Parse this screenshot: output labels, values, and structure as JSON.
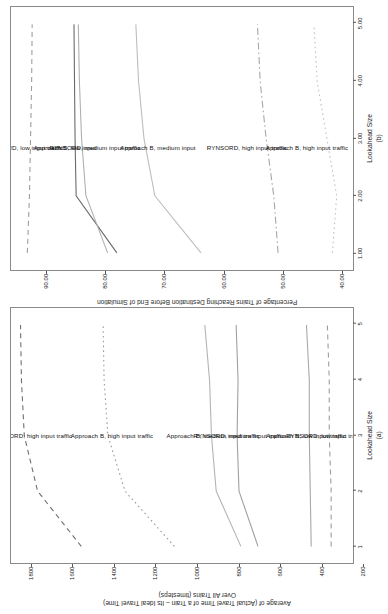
{
  "figure": {
    "panels": [
      "a",
      "b"
    ]
  },
  "chart_data": [
    {
      "id": "panel-a",
      "type": "line",
      "title": "",
      "panel_label": "(a)",
      "xlabel": "Lookahead Size",
      "ylabel": "Average of (Actual Travel Time of a Train – Its Ideal Travel Time)\nOver All Trains (timesteps)",
      "x": [
        1,
        2,
        3,
        4,
        5
      ],
      "xticklabels": [
        "1",
        "2",
        "3",
        "4",
        "5"
      ],
      "xlim": [
        0.7,
        5.3
      ],
      "ylim": [
        100,
        1900
      ],
      "yticks": [
        200,
        400,
        600,
        800,
        1000,
        1200,
        1400,
        1600,
        1800
      ],
      "yticklabels": [
        "200",
        "400",
        "600",
        "800",
        "1000",
        "1200",
        "1400",
        "1600",
        "1800"
      ],
      "grid": false,
      "legend_position": "inline-labels",
      "series": [
        {
          "name": "RYNSORD, high input traffic",
          "values": [
            1530,
            1760,
            1830,
            1845,
            1850
          ],
          "style": "dashed",
          "color": "#6f6f6f",
          "label_x": 3.05,
          "label_y": 1790
        },
        {
          "name": "Approach B, high input traffic",
          "values": [
            1040,
            1300,
            1390,
            1410,
            1415
          ],
          "style": "dotted",
          "color": "#9a9a9a",
          "label_x": 3.05,
          "label_y": 1370
        },
        {
          "name": "Approach B, medium input traffic",
          "values": [
            690,
            820,
            845,
            855,
            880
          ],
          "style": "solid",
          "color": "#b4b4b4",
          "label_x": 3.05,
          "label_y": 835
        },
        {
          "name": "RYNSORD, medium input traffic",
          "values": [
            600,
            700,
            710,
            705,
            715
          ],
          "style": "solid",
          "color": "#a0a0a0",
          "label_x": 3.05,
          "label_y": 700
        },
        {
          "name": "Approach B, low input traffic",
          "values": [
            320,
            325,
            330,
            330,
            345
          ],
          "style": "solid",
          "color": "#a8a8a8",
          "label_x": 3.05,
          "label_y": 345
        },
        {
          "name": "RYNSORD, low input traffic",
          "values": [
            215,
            215,
            225,
            225,
            235
          ],
          "style": "dashed",
          "color": "#9d9d9d",
          "label_x": 3.05,
          "label_y": 250
        }
      ]
    },
    {
      "id": "panel-b",
      "type": "line",
      "title": "",
      "panel_label": "(b)",
      "xlabel": "Lookahead Size",
      "ylabel": "Percentage of Trains Reaching Destination Before End of Simulation",
      "x": [
        1,
        2,
        3,
        4,
        5
      ],
      "xticklabels": [
        "1.00",
        "2.00",
        "3.00",
        "4.00",
        "5.00"
      ],
      "xlim": [
        0.7,
        5.3
      ],
      "ylim": [
        33,
        96
      ],
      "yticks": [
        40,
        50,
        60,
        70,
        80,
        90
      ],
      "yticklabels": [
        "40.00",
        "50.00",
        "60.00",
        "70.00",
        "80.00",
        "90.00"
      ],
      "grid": false,
      "legend_position": "inline-labels",
      "series": [
        {
          "name": "RYNSORD, low input traffic",
          "values": [
            93.0,
            92.6,
            92.4,
            92.2,
            92.1
          ],
          "style": "dashed",
          "color": "#9d9d9d",
          "label_x": 2.9,
          "label_y": 93.6
        },
        {
          "name": "Approach B, low input",
          "values": [
            76.5,
            84.0,
            84.2,
            84.3,
            84.4
          ],
          "style": "solid",
          "color": "#6a6a6a",
          "label_x": 2.9,
          "label_y": 86.0
        },
        {
          "name": "RYNSORD, medium input traffic",
          "values": [
            78.2,
            82.2,
            83.0,
            83.4,
            83.6
          ],
          "style": "solid",
          "color": "#b0b0b0",
          "label_x": 2.9,
          "label_y": 80.5
        },
        {
          "name": "Approach B, medium input",
          "values": [
            61.0,
            69.5,
            71.5,
            72.5,
            73.0
          ],
          "style": "solid",
          "color": "#bdbdbd",
          "label_x": 2.9,
          "label_y": 69.0
        },
        {
          "name": "RYNSORD, high input traffic",
          "values": [
            46.8,
            47.6,
            49.0,
            50.1,
            50.6
          ],
          "style": "dashdot",
          "color": "#a6a6a6",
          "label_x": 2.9,
          "label_y": 52.5
        },
        {
          "name": "Approach B, high input traffic",
          "values": [
            36.8,
            36.0,
            37.8,
            39.6,
            40.2
          ],
          "style": "dotted",
          "color": "#c0c0c0",
          "label_x": 2.9,
          "label_y": 41.5
        }
      ]
    }
  ]
}
